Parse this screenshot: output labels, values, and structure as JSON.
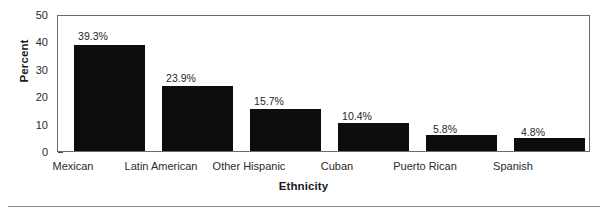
{
  "chart_data": {
    "type": "bar",
    "title": "",
    "xlabel": "Ethnicity",
    "ylabel": "Percent",
    "categories": [
      "Mexican",
      "Latin American",
      "Other Hispanic",
      "Cuban",
      "Puerto Rican",
      "Spanish"
    ],
    "values": [
      39.3,
      23.9,
      15.7,
      10.4,
      5.8,
      4.8
    ],
    "value_labels": [
      "39.3%",
      "23.9%",
      "15.7%",
      "10.4%",
      "5.8%",
      "4.8%"
    ],
    "ylim": [
      0,
      50
    ],
    "yticks": [
      50,
      40,
      30,
      20,
      10,
      0
    ],
    "ytick_labels": [
      "50",
      "40",
      "30",
      "20",
      "10",
      "0"
    ],
    "grid": false,
    "legend": null,
    "bar_color": "#0d0d0d",
    "frame_color": "#6b6b6b",
    "background": "#ffffff"
  }
}
